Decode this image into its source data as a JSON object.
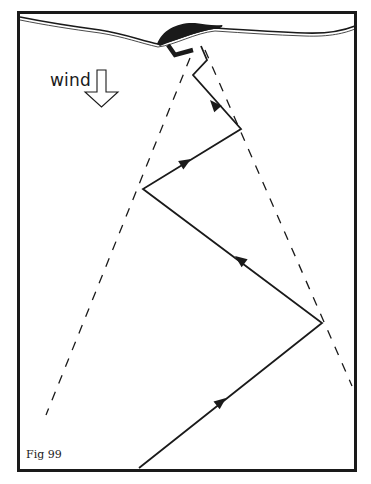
{
  "figure": {
    "label": "Fig 99",
    "wind_label": "wind",
    "colors": {
      "ink": "#1a1a1a",
      "background": "#ffffff"
    },
    "frame": {
      "x": 18,
      "y": 12,
      "width": 338,
      "height": 459
    },
    "shoreline": "wavy double line near top of frame",
    "target_object": "black mound on shoreline",
    "start_marker": "L-shaped bracket below mound",
    "path": {
      "description": "zig-zag track approaching target upwind",
      "points": [
        [
          139,
          468
        ],
        [
          322,
          323
        ],
        [
          143,
          189
        ],
        [
          241,
          129
        ],
        [
          193,
          75
        ],
        [
          207,
          60
        ],
        [
          201,
          46
        ]
      ],
      "arrows": [
        {
          "x": 222,
          "y": 400,
          "direction": "up-right"
        },
        {
          "x": 238,
          "y": 260,
          "direction": "up-left"
        },
        {
          "x": 187,
          "y": 162,
          "direction": "up-right"
        },
        {
          "x": 213,
          "y": 104,
          "direction": "up-left"
        }
      ]
    },
    "cone": {
      "description": "dashed lines bounding scent cone",
      "left": [
        [
          190,
          58
        ],
        [
          46,
          415
        ]
      ],
      "right": [
        [
          205,
          50
        ],
        [
          352,
          386
        ]
      ]
    }
  }
}
